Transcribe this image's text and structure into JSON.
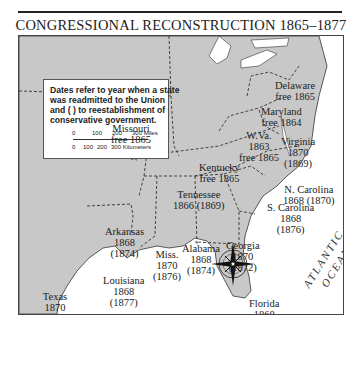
{
  "title": "CONGRESSIONAL RECONSTRUCTION 1865–1877",
  "legend": {
    "text": "Dates refer to year when a state\nwas readmitted to the Union\nand ( ) to reestablishment of\nconservative government.",
    "scale_miles": [
      "0",
      "100",
      "200",
      "300 Miles"
    ],
    "scale_km": [
      "0",
      "100",
      "200",
      "300 Kilometers"
    ]
  },
  "states": [
    {
      "name": "Delaware",
      "label": "Delaware\nfree 1865"
    },
    {
      "name": "Maryland",
      "label": "Maryland\nfree 1864"
    },
    {
      "name": "West Virginia",
      "label": "W.Va.\n1863\nfree 1865"
    },
    {
      "name": "Virginia",
      "label": "Virginia\n1870\n(1869)"
    },
    {
      "name": "Missouri",
      "label": "Missouri\nfree 1865"
    },
    {
      "name": "Kentucky",
      "label": "Kentucky\nfree 1865"
    },
    {
      "name": "Tennessee",
      "label": "Tennessee\n1866 (1869)"
    },
    {
      "name": "North Carolina",
      "label": "N. Carolina\n1868 (1870)"
    },
    {
      "name": "South Carolina",
      "label": "S. Carolina\n1868\n(1876)"
    },
    {
      "name": "Arkansas",
      "label": "Arkansas\n1868\n(1874)"
    },
    {
      "name": "Mississippi",
      "label": "Miss.\n1870\n(1876)"
    },
    {
      "name": "Alabama",
      "label": "Alabama\n1868\n(1874)"
    },
    {
      "name": "Georgia",
      "label": "Georgia\n1870\n(1872)"
    },
    {
      "name": "Louisiana",
      "label": "Louisiana\n1868\n(1877)"
    },
    {
      "name": "Texas",
      "label": "Texas\n1870\n(1873)"
    },
    {
      "name": "Florida",
      "label": "Florida\n1868\n(1877)"
    }
  ],
  "water": {
    "atlantic": "ATLANTIC\nOCEAN",
    "gulf": "GULF OF\nMEXICO"
  },
  "compass": {
    "north": "N"
  },
  "colors": {
    "land": "#c8c8c8",
    "water": "#ffffff",
    "border": "#333333"
  }
}
